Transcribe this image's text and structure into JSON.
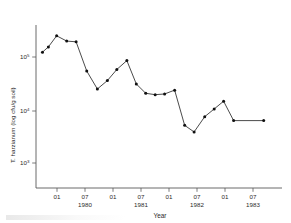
{
  "chart_data": {
    "type": "line",
    "title": "",
    "xlabel": "Year",
    "ylabel": "T. harzianum (log cfu/g soil)",
    "yscale": "log",
    "ylim": [
      316,
      316228
    ],
    "y_tick_values": [
      100000,
      10000,
      1000
    ],
    "y_tick_labels": [
      "10",
      "10",
      "10"
    ],
    "y_tick_exponents": [
      "5",
      "4",
      "3"
    ],
    "xlim": [
      1979.45,
      1983.62
    ],
    "x_tick_positions": [
      1980.0,
      1980.5,
      1981.0,
      1981.5,
      1982.0,
      1982.5,
      1983.0,
      1983.5
    ],
    "x_tick_labels": [
      "01",
      "07",
      "01",
      "07",
      "01",
      "07",
      "01",
      "07"
    ],
    "x_year_labels": [
      {
        "label": "1980",
        "position": 1980.5
      },
      {
        "label": "1981",
        "position": 1981.5
      },
      {
        "label": "1982",
        "position": 1982.5
      },
      {
        "label": "1983",
        "position": 1983.5
      }
    ],
    "grid": false,
    "legend": false,
    "legend_position": "none",
    "series": [
      {
        "name": "T. harzianum",
        "marker": "filled-circle",
        "line_color": "#2b2b2b",
        "marker_color": "#101010",
        "x": [
          1979.56,
          1979.66,
          1979.8,
          1979.97,
          1980.13,
          1980.31,
          1980.49,
          1980.66,
          1980.82,
          1980.99,
          1981.15,
          1981.31,
          1981.47,
          1981.63,
          1981.8,
          1981.97,
          1982.13,
          1982.31,
          1982.47,
          1982.63,
          1982.8,
          1983.31
        ],
        "y": [
          100000,
          125000,
          200000,
          160000,
          155000,
          45000,
          21000,
          30000,
          48000,
          70000,
          26000,
          17500,
          16500,
          17000,
          20000,
          4500,
          3400,
          6500,
          9000,
          12500,
          5500,
          5500
        ]
      }
    ]
  },
  "figure": {
    "axis_color": "#5a5a5a",
    "background": "#ffffff",
    "y_axis_title": "T. harzianum (log cfu/g soil)",
    "x_axis_title": "Year"
  }
}
